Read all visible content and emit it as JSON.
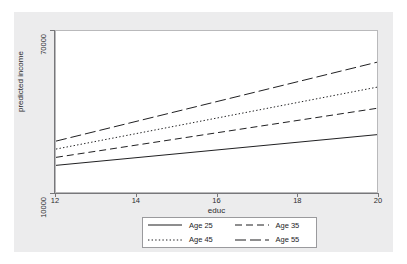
{
  "figure": {
    "background_color": "#ececed",
    "plot_background_color": "#ffffff",
    "axis_color": "#77777a",
    "line_color": "#1d1d1f"
  },
  "chart_data": {
    "type": "line",
    "title": "",
    "xlabel": "educ",
    "ylabel": "predicted income",
    "xlim": [
      12,
      20
    ],
    "ylim": [
      10000,
      70000
    ],
    "yscale": "log",
    "grid": false,
    "legend_position": "below-center",
    "xticks": [
      "12",
      "14",
      "16",
      "18",
      "20"
    ],
    "xtick_values": [
      12,
      14,
      16,
      18,
      20
    ],
    "yticks": [
      "10000",
      "70000"
    ],
    "ytick_values": [
      10000,
      70000
    ],
    "x": [
      12,
      20
    ],
    "series": [
      {
        "name": "Age 25",
        "style": "solid",
        "values": [
          13800,
          20000
        ]
      },
      {
        "name": "Age 35",
        "style": "dashed",
        "values": [
          15200,
          27500
        ]
      },
      {
        "name": "Age 45",
        "style": "dotted",
        "values": [
          16800,
          35500
        ]
      },
      {
        "name": "Age 55",
        "style": "dashdot",
        "values": [
          18500,
          48000
        ]
      }
    ]
  },
  "legend": {
    "items": [
      {
        "label": "Age 25",
        "style": "solid"
      },
      {
        "label": "Age 35",
        "style": "dashed"
      },
      {
        "label": "Age 45",
        "style": "dotted"
      },
      {
        "label": "Age 55",
        "style": "dashdot"
      }
    ]
  }
}
